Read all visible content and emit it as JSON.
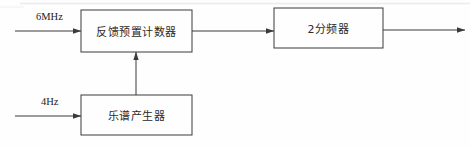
{
  "diagram": {
    "background_color": "#fefefe",
    "line_color": "#3a3a3a",
    "text_color": "#2a2a2a",
    "blocks": [
      {
        "id": "feedback-preset-counter",
        "label": "反馈预置计数器"
      },
      {
        "id": "divide-by-2",
        "label": "2分频器"
      },
      {
        "id": "score-generator",
        "label": "乐谱产生器"
      }
    ],
    "signals": [
      {
        "id": "clock-in",
        "label": "6MHz"
      },
      {
        "id": "note-clock-in",
        "label": "4Hz"
      }
    ]
  }
}
